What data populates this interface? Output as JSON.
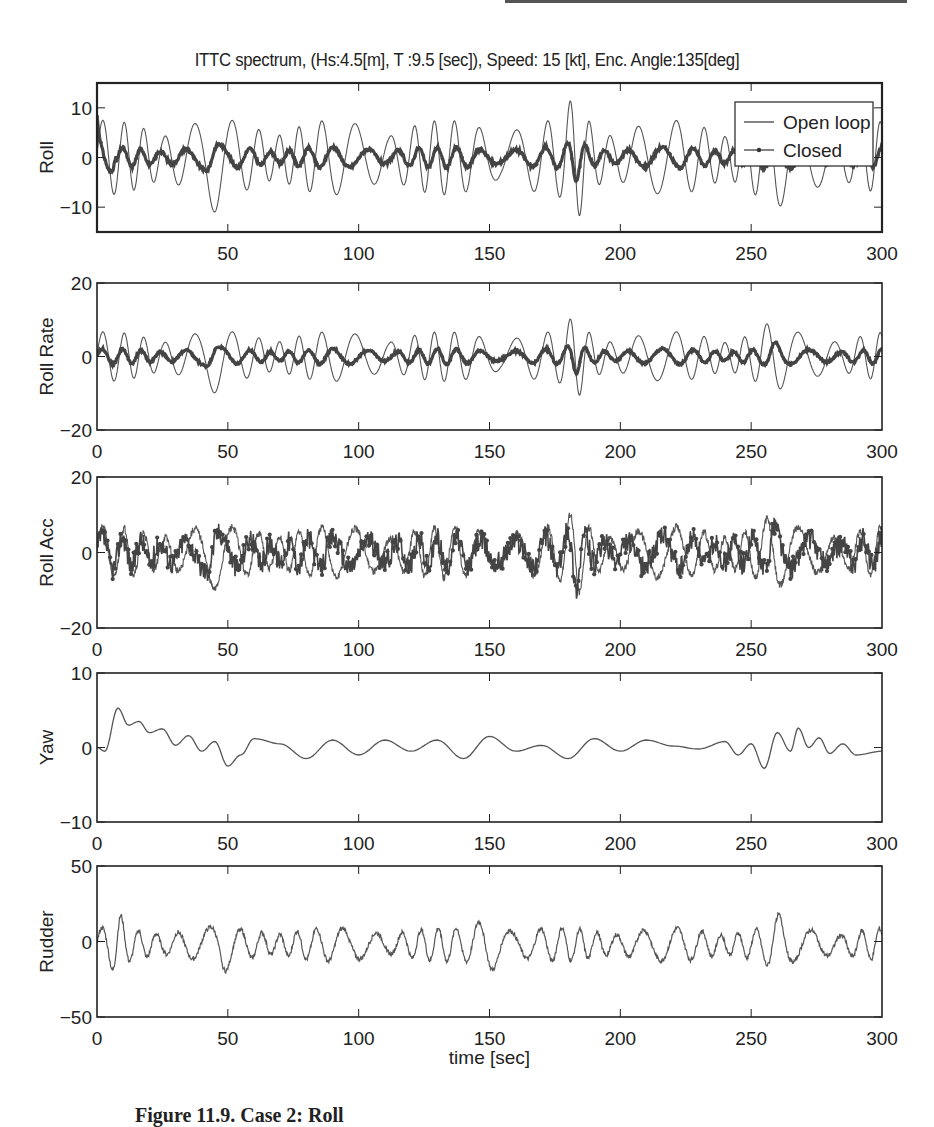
{
  "header": {
    "title": "ITTC spectrum, (Hs:4.5[m], T :9.5 [sec]), Speed: 15 [kt],  Enc. Angle:135[deg]"
  },
  "caption": {
    "text": "Figure 11.9. Case 2: Roll"
  },
  "legend": {
    "items": [
      {
        "label": "Open loop",
        "style": "thin-line"
      },
      {
        "label": "Closed",
        "style": "line-with-dots"
      }
    ]
  },
  "colors": {
    "open_loop": "#555555",
    "closed": "#444444",
    "axes": "#222222"
  },
  "chart_data": [
    {
      "type": "line",
      "title": "ITTC spectrum, (Hs:4.5[m], T :9.5 [sec]), Speed: 15 [kt],  Enc. Angle:135[deg]",
      "ylabel": "Roll",
      "xlabel": "",
      "xlim": [
        0,
        300
      ],
      "ylim": [
        -15,
        15
      ],
      "xticks": [
        50,
        100,
        150,
        200,
        250,
        300
      ],
      "yticks": [
        10,
        0,
        -10
      ],
      "legend_position": "upper right",
      "series": [
        {
          "name": "Open loop",
          "amplitude_approx": 10,
          "peak_max": 12,
          "peak_min": -11
        },
        {
          "name": "Closed",
          "amplitude_approx": 3,
          "initial_value": 8,
          "peak_max": 4,
          "peak_min": -4
        }
      ]
    },
    {
      "type": "line",
      "ylabel": "Roll Rate",
      "xlim": [
        0,
        300
      ],
      "ylim": [
        -20,
        20
      ],
      "xticks": [
        0,
        50,
        100,
        150,
        200,
        250,
        300
      ],
      "yticks": [
        20,
        0,
        -20
      ],
      "series": [
        {
          "name": "Open loop",
          "amplitude_approx": 9,
          "peak_max": 11,
          "peak_min": -12
        },
        {
          "name": "Closed",
          "amplitude_approx": 3,
          "peak_max": 5,
          "peak_min": -9
        }
      ]
    },
    {
      "type": "line",
      "ylabel": "Roll Acc",
      "xlim": [
        0,
        300
      ],
      "ylim": [
        -20,
        20
      ],
      "xticks": [
        0,
        50,
        100,
        150,
        200,
        250,
        300
      ],
      "yticks": [
        20,
        0,
        -20
      ],
      "series": [
        {
          "name": "Open loop",
          "amplitude_approx": 9,
          "peak_max": 13,
          "peak_min": -15
        },
        {
          "name": "Closed",
          "amplitude_approx": 6,
          "peak_max": 12,
          "peak_min": -14
        }
      ]
    },
    {
      "type": "line",
      "ylabel": "Yaw",
      "xlim": [
        0,
        300
      ],
      "ylim": [
        -10,
        10
      ],
      "xticks": [
        0,
        50,
        100,
        150,
        200,
        250,
        300
      ],
      "yticks": [
        10,
        0,
        -10
      ],
      "series": [
        {
          "name": "Closed",
          "points": [
            [
              0,
              0
            ],
            [
              3,
              -0.5
            ],
            [
              8,
              5.3
            ],
            [
              12,
              3
            ],
            [
              16,
              3.5
            ],
            [
              20,
              2
            ],
            [
              25,
              2.5
            ],
            [
              30,
              0.3
            ],
            [
              35,
              1.6
            ],
            [
              40,
              -0.5
            ],
            [
              45,
              0.8
            ],
            [
              50,
              -2.5
            ],
            [
              55,
              -1
            ],
            [
              60,
              1.2
            ],
            [
              70,
              0.5
            ],
            [
              80,
              -1.5
            ],
            [
              90,
              1
            ],
            [
              100,
              -1
            ],
            [
              110,
              1
            ],
            [
              120,
              -0.5
            ],
            [
              130,
              1
            ],
            [
              140,
              -1.5
            ],
            [
              150,
              1.5
            ],
            [
              160,
              -0.5
            ],
            [
              170,
              0.3
            ],
            [
              180,
              -1.5
            ],
            [
              190,
              1.2
            ],
            [
              200,
              -0.5
            ],
            [
              210,
              1
            ],
            [
              220,
              0.2
            ],
            [
              230,
              -0.2
            ],
            [
              240,
              0.8
            ],
            [
              245,
              -1
            ],
            [
              250,
              0.5
            ],
            [
              255,
              -2.8
            ],
            [
              260,
              2
            ],
            [
              265,
              -0.5
            ],
            [
              268,
              2.6
            ],
            [
              272,
              0
            ],
            [
              276,
              1.3
            ],
            [
              280,
              -0.8
            ],
            [
              285,
              0.5
            ],
            [
              290,
              -1
            ],
            [
              300,
              -0.5
            ]
          ]
        }
      ]
    },
    {
      "type": "line",
      "ylabel": "Rudder",
      "xlabel": "time [sec]",
      "xlim": [
        0,
        300
      ],
      "ylim": [
        -50,
        50
      ],
      "xticks": [
        0,
        50,
        100,
        150,
        200,
        250,
        300
      ],
      "yticks": [
        50,
        0,
        -50
      ],
      "series": [
        {
          "name": "Closed",
          "amplitude_approx": 15,
          "peak_max": 22,
          "peak_min": -25
        }
      ]
    }
  ],
  "panels": [
    {
      "ylabel": "Roll",
      "yticks": [
        "10",
        "0",
        "−10"
      ],
      "xticks": [
        "50",
        "100",
        "150",
        "200",
        "250",
        "300"
      ]
    },
    {
      "ylabel": "Roll Rate",
      "yticks": [
        "20",
        "0",
        "−20"
      ],
      "xticks": [
        "0",
        "50",
        "100",
        "150",
        "200",
        "250",
        "300"
      ]
    },
    {
      "ylabel": "Roll Acc",
      "yticks": [
        "20",
        "0",
        "−20"
      ],
      "xticks": [
        "0",
        "50",
        "100",
        "150",
        "200",
        "250",
        "300"
      ]
    },
    {
      "ylabel": "Yaw",
      "yticks": [
        "10",
        "0",
        "−10"
      ],
      "xticks": [
        "0",
        "50",
        "100",
        "150",
        "200",
        "250",
        "300"
      ]
    },
    {
      "ylabel": "Rudder",
      "yticks": [
        "50",
        "0",
        "−50"
      ],
      "xticks": [
        "0",
        "50",
        "100",
        "150",
        "200",
        "250",
        "300"
      ]
    }
  ],
  "xaxis": {
    "label": "time [sec]"
  }
}
